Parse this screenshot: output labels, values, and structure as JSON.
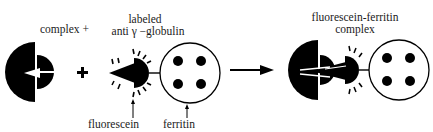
{
  "diagram": {
    "colors": {
      "ink": "#000000",
      "background": "#ffffff"
    },
    "labels": {
      "complex_plus": "complex +",
      "labeled_line1": "labeled",
      "labeled_line2": "anti γ −globulin",
      "fluorescein": "fluorescein",
      "ferritin": "ferritin",
      "result_line1": "fluorescein-ferritin",
      "result_line2": "complex"
    },
    "operators": {
      "plus": "+"
    },
    "nodes": [
      {
        "id": "antigen-complex",
        "label": "complex"
      },
      {
        "id": "labeled-antibody",
        "label": "labeled anti γ −globulin"
      },
      {
        "id": "fluorescein-label",
        "label": "fluorescein"
      },
      {
        "id": "ferritin-label",
        "label": "ferritin"
      },
      {
        "id": "result-complex",
        "label": "fluorescein-ferritin complex"
      }
    ],
    "edges": [
      {
        "from": "antigen-complex",
        "to": "result-complex",
        "type": "reaction-arrow"
      }
    ]
  }
}
